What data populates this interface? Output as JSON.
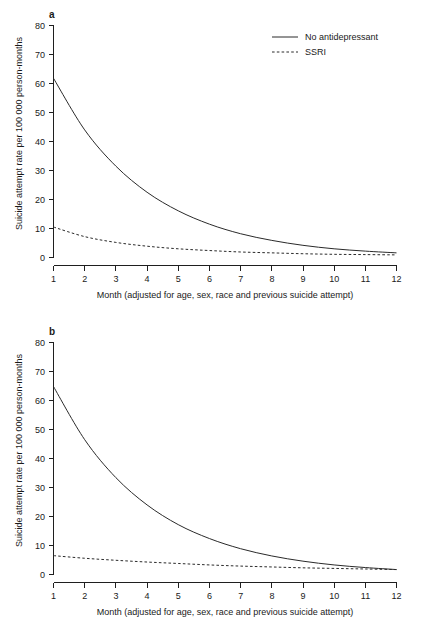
{
  "figure": {
    "panels": [
      {
        "letter": "a",
        "legend": [
          {
            "label": "No antidepressant",
            "style": "solid"
          },
          {
            "label": "SSRI",
            "style": "dashed"
          }
        ]
      },
      {
        "letter": "b",
        "legend": []
      }
    ],
    "axis": {
      "ylabel": "Suicide attempt rate per 100 000 person-months",
      "xlabel": "Month (adjusted for age, sex, race and previous suicide attempt)",
      "yticks": [
        "0",
        "10",
        "20",
        "30",
        "40",
        "50",
        "60",
        "70",
        "80"
      ],
      "xticks": [
        "1",
        "2",
        "3",
        "4",
        "5",
        "6",
        "7",
        "8",
        "9",
        "10",
        "11",
        "12"
      ]
    }
  },
  "chart_data": [
    {
      "type": "line",
      "panel": "a",
      "title": "",
      "xlabel": "Month (adjusted for age, sex, race and previous suicide attempt)",
      "ylabel": "Suicide attempt rate per 100 000 person-months",
      "xlim": [
        1,
        12
      ],
      "ylim": [
        0,
        80
      ],
      "grid": false,
      "legend_position": "top-right",
      "x": [
        1,
        2,
        3,
        4,
        5,
        6,
        7,
        8,
        9,
        10,
        11,
        12
      ],
      "series": [
        {
          "name": "No antidepressant",
          "style": "solid",
          "values": [
            61.8,
            44.0,
            31.5,
            22.5,
            16.1,
            11.5,
            8.2,
            5.9,
            4.2,
            3.0,
            2.2,
            1.6
          ]
        },
        {
          "name": "SSRI",
          "style": "dashed",
          "values": [
            10.5,
            7.2,
            5.2,
            3.9,
            3.0,
            2.4,
            1.9,
            1.6,
            1.3,
            1.1,
            1.0,
            0.9
          ]
        }
      ]
    },
    {
      "type": "line",
      "panel": "b",
      "title": "",
      "xlabel": "Month (adjusted for age, sex, race and previous suicide attempt)",
      "ylabel": "Suicide attempt rate per 100 000 person-months",
      "xlim": [
        1,
        12
      ],
      "ylim": [
        0,
        80
      ],
      "grid": false,
      "legend_position": "none",
      "x": [
        1,
        2,
        3,
        4,
        5,
        6,
        7,
        8,
        9,
        10,
        11,
        12
      ],
      "series": [
        {
          "name": "No antidepressant",
          "style": "solid",
          "values": [
            64.8,
            46.5,
            33.4,
            24.0,
            17.2,
            12.4,
            8.9,
            6.4,
            4.6,
            3.3,
            2.4,
            1.7
          ]
        },
        {
          "name": "SSRI",
          "style": "dashed",
          "values": [
            6.5,
            5.6,
            4.9,
            4.3,
            3.8,
            3.3,
            2.9,
            2.6,
            2.3,
            2.1,
            1.9,
            1.7
          ]
        }
      ]
    }
  ]
}
